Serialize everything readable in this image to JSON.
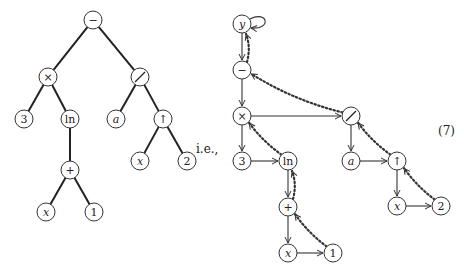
{
  "tree": {
    "nodes": [
      {
        "id": "minus",
        "label": "−",
        "x": 93,
        "y": 20
      },
      {
        "id": "times",
        "label": "×",
        "x": 48,
        "y": 77
      },
      {
        "id": "div",
        "label": "⁄",
        "x": 140,
        "y": 77
      },
      {
        "id": "three",
        "label": "3",
        "x": 24,
        "y": 119
      },
      {
        "id": "ln",
        "label": "ln",
        "x": 70,
        "y": 119
      },
      {
        "id": "a",
        "label": "a",
        "x": 116,
        "y": 119,
        "italic": true
      },
      {
        "id": "pow",
        "label": "↑",
        "x": 163,
        "y": 119
      },
      {
        "id": "plus",
        "label": "+",
        "x": 70,
        "y": 170
      },
      {
        "id": "x1",
        "label": "x",
        "x": 46,
        "y": 212,
        "italic": true
      },
      {
        "id": "one",
        "label": "1",
        "x": 94,
        "y": 212
      },
      {
        "id": "x2",
        "label": "x",
        "x": 140,
        "y": 161,
        "italic": true
      },
      {
        "id": "two",
        "label": "2",
        "x": 187,
        "y": 161
      }
    ],
    "edges": [
      [
        "minus",
        "times"
      ],
      [
        "minus",
        "div"
      ],
      [
        "times",
        "three"
      ],
      [
        "times",
        "ln"
      ],
      [
        "div",
        "a"
      ],
      [
        "div",
        "pow"
      ],
      [
        "ln",
        "plus"
      ],
      [
        "plus",
        "x1"
      ],
      [
        "plus",
        "one"
      ],
      [
        "pow",
        "x2"
      ],
      [
        "pow",
        "two"
      ]
    ]
  },
  "ie_label": "i.e.,",
  "equation_number": "(7)",
  "graph": {
    "nodes": [
      {
        "id": "y",
        "label": "y",
        "x": 242,
        "y": 24,
        "italic": true
      },
      {
        "id": "minus",
        "label": "−",
        "x": 242,
        "y": 70
      },
      {
        "id": "times",
        "label": "×",
        "x": 242,
        "y": 116
      },
      {
        "id": "div",
        "label": "⁄",
        "x": 351,
        "y": 116
      },
      {
        "id": "three",
        "label": "3",
        "x": 242,
        "y": 161
      },
      {
        "id": "ln",
        "label": "ln",
        "x": 288,
        "y": 161
      },
      {
        "id": "a",
        "label": "a",
        "x": 351,
        "y": 161,
        "italic": true
      },
      {
        "id": "pow",
        "label": "↑",
        "x": 397,
        "y": 161
      },
      {
        "id": "plus",
        "label": "+",
        "x": 288,
        "y": 207
      },
      {
        "id": "x1",
        "label": "x",
        "x": 288,
        "y": 253,
        "italic": true
      },
      {
        "id": "one",
        "label": "1",
        "x": 333,
        "y": 253
      },
      {
        "id": "x2",
        "label": "x",
        "x": 397,
        "y": 206,
        "italic": true
      },
      {
        "id": "two",
        "label": "2",
        "x": 441,
        "y": 206
      }
    ],
    "child_edges": [
      [
        "y",
        "minus"
      ],
      [
        "minus",
        "times"
      ],
      [
        "times",
        "three"
      ],
      [
        "ln",
        "plus"
      ],
      [
        "plus",
        "x1"
      ],
      [
        "div",
        "a"
      ],
      [
        "pow",
        "x2"
      ]
    ],
    "sibling_edges": [
      [
        "times",
        "div"
      ],
      [
        "three",
        "ln"
      ],
      [
        "x1",
        "one"
      ],
      [
        "a",
        "pow"
      ],
      [
        "x2",
        "two"
      ]
    ],
    "parent_edges": [
      [
        "minus",
        "y"
      ],
      [
        "div",
        "minus"
      ],
      [
        "ln",
        "times"
      ],
      [
        "plus",
        "ln"
      ],
      [
        "one",
        "plus"
      ],
      [
        "pow",
        "div"
      ],
      [
        "two",
        "pow"
      ]
    ]
  }
}
